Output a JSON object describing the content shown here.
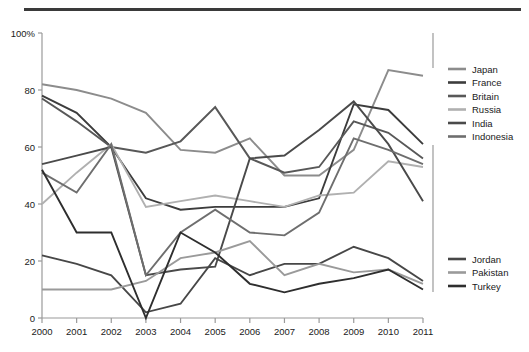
{
  "chart_data": {
    "type": "line",
    "title": "",
    "subtitle": "",
    "xlabel": "",
    "ylabel": "",
    "x": [
      2000,
      2001,
      2002,
      2003,
      2004,
      2005,
      2006,
      2007,
      2008,
      2009,
      2010,
      2011
    ],
    "xtick_labels": [
      "2000",
      "2001",
      "2002",
      "2003",
      "2004",
      "2005",
      "2006",
      "2007",
      "2008",
      "2009",
      "2010",
      "2011"
    ],
    "ytick_labels": [
      "0",
      "20",
      "40",
      "60",
      "80",
      "100%"
    ],
    "yticks": [
      0,
      20,
      40,
      60,
      80,
      100
    ],
    "ylim": [
      0,
      100
    ],
    "xlim": [
      2000,
      2011
    ],
    "grid": false,
    "legend_position": "right",
    "series": [
      {
        "name": "Japan",
        "color": "#8c8c8c",
        "values": [
          82,
          80,
          77,
          72,
          59,
          58,
          63,
          50,
          50,
          59,
          87,
          85
        ]
      },
      {
        "name": "France",
        "color": "#3c3c3c",
        "values": [
          78,
          72,
          60,
          42,
          38,
          39,
          39,
          39,
          42,
          75,
          73,
          61
        ]
      },
      {
        "name": "Britain",
        "color": "#585858",
        "values": [
          77,
          69,
          60,
          58,
          62,
          74,
          56,
          51,
          53,
          69,
          65,
          56
        ]
      },
      {
        "name": "Russia",
        "color": "#b0b0b0",
        "values": [
          40,
          51,
          61,
          39,
          41,
          43,
          41,
          39,
          43,
          44,
          55,
          53
        ]
      },
      {
        "name": "India",
        "color": "#4a4a4a",
        "values": [
          54,
          57,
          60,
          15,
          17,
          18,
          56,
          57,
          66,
          76,
          61,
          41
        ]
      },
      {
        "name": "Indonesia",
        "color": "#6e6e6e",
        "values": [
          51,
          44,
          61,
          15,
          30,
          38,
          30,
          29,
          37,
          63,
          59,
          54
        ]
      },
      {
        "name": "Jordan",
        "color": "#474747",
        "values": [
          22,
          19,
          15,
          2,
          5,
          21,
          15,
          19,
          19,
          25,
          21,
          13
        ]
      },
      {
        "name": "Pakistan",
        "color": "#9a9a9a",
        "values": [
          10,
          10,
          10,
          13,
          21,
          23,
          27,
          15,
          19,
          16,
          17,
          12
        ]
      },
      {
        "name": "Turkey",
        "color": "#2e2e2e",
        "values": [
          52,
          30,
          30,
          0,
          30,
          23,
          12,
          9,
          12,
          14,
          17,
          10
        ]
      }
    ]
  },
  "legend_groups": [
    {
      "items": [
        "Japan",
        "France",
        "Britain",
        "Russia",
        "India",
        "Indonesia"
      ]
    },
    {
      "items": [
        "Jordan",
        "Pakistan",
        "Turkey"
      ]
    }
  ],
  "colors": {
    "axis": "#9a9a9a",
    "axis_text": "#1a1a1a",
    "top_rule": "#3a3a3a",
    "background": "#ffffff"
  }
}
